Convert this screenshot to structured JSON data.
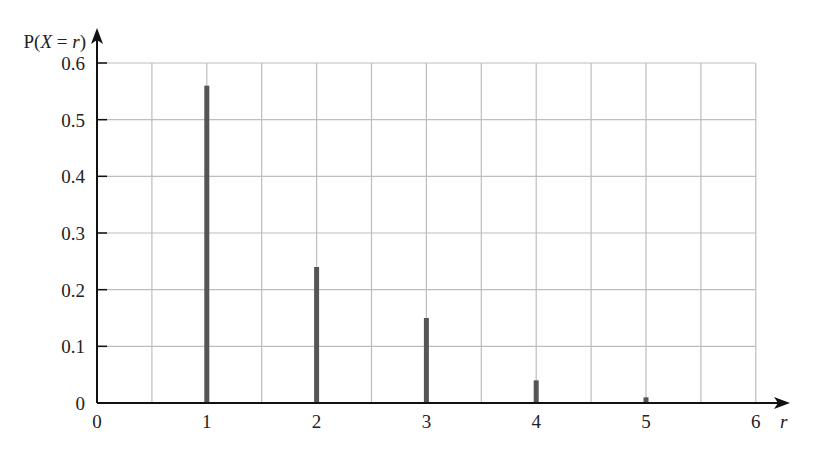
{
  "chart_data": {
    "type": "bar",
    "title": "",
    "xlabel": "r",
    "ylabel": "P(X = r)",
    "categories": [
      1,
      2,
      3,
      4,
      5
    ],
    "values": [
      0.56,
      0.24,
      0.15,
      0.04,
      0.01
    ],
    "xlim": [
      0,
      6
    ],
    "ylim": [
      0,
      0.6
    ],
    "x_ticks": [
      "0",
      "1",
      "2",
      "3",
      "4",
      "5",
      "6"
    ],
    "y_ticks": [
      "0",
      "0.1",
      "0.2",
      "0.3",
      "0.4",
      "0.5",
      "0.6"
    ],
    "grid": true,
    "grid_x_step": 0.5,
    "grid_y_step": 0.1,
    "legend": null,
    "bar_style": "thin vertical lines (probability distribution)"
  },
  "colors": {
    "bar": "#555555",
    "grid": "#bdbdbd",
    "axis": "#111111",
    "text": "#222222"
  },
  "axis_labels": {
    "y_prefix": "P(",
    "y_var": "X",
    "y_eq": " = ",
    "y_r": "r",
    "y_suffix": ")",
    "x": "r"
  }
}
